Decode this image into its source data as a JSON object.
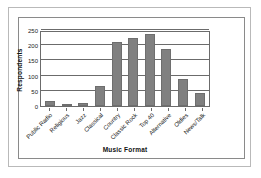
{
  "chart_data": {
    "type": "bar",
    "title": "",
    "xlabel": "Music Format",
    "ylabel": "Respondents",
    "categories": [
      "Public Radio",
      "Religious",
      "Jazz",
      "Classical",
      "Country",
      "Classic Rock",
      "Top 40",
      "Alternative",
      "Oldies",
      "News/Talk"
    ],
    "values": [
      15,
      8,
      9,
      66,
      210,
      225,
      236,
      186,
      88,
      42
    ],
    "ylim": [
      0,
      250
    ],
    "yticks": [
      0,
      50,
      100,
      150,
      200,
      250
    ],
    "ytick_labels": [
      "0",
      "50",
      "100",
      "150",
      "200",
      "250"
    ],
    "grid": true,
    "legend": false,
    "bar_color": "#808080",
    "axis_color": "#6b6b6b",
    "background": "#ffffff"
  }
}
